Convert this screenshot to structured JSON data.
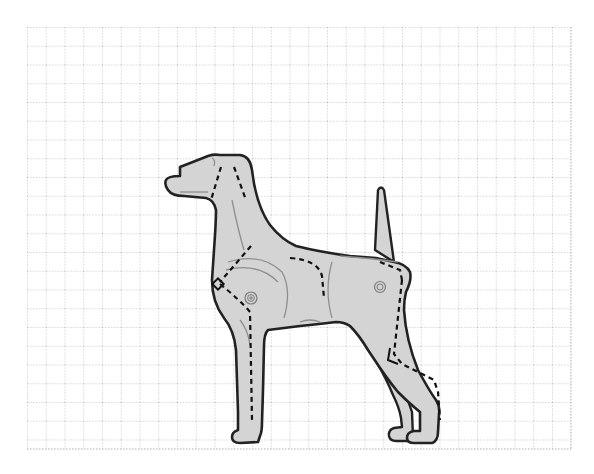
{
  "figure": {
    "background": "#ffffff"
  },
  "grid": {
    "x0": 27,
    "y0": 27,
    "x1": 571,
    "y1": 449,
    "cell": 18.75,
    "line_color": "#a6a6a6",
    "line_style": "dotted"
  },
  "dog": {
    "fill": "#d4d4d4",
    "outline": "#222222",
    "inner_line": "#8a8a8a",
    "dash_color": "#111111",
    "markers": [
      {
        "name": "shoulder-joint-marker",
        "symbol": "circle-plus",
        "cx": 251,
        "cy": 298
      },
      {
        "name": "hip-joint-marker",
        "symbol": "circle-dot",
        "cx": 380,
        "cy": 287
      }
    ]
  }
}
